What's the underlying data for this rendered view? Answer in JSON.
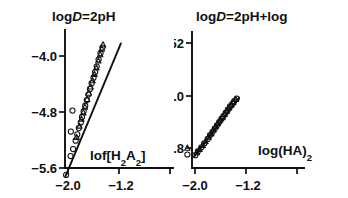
{
  "figure": {
    "background_color": "#ffffff",
    "ink_color": "#101010",
    "width": 348,
    "height": 198
  },
  "chart_data": [
    {
      "type": "scatter",
      "panel": "left",
      "title": "logD=2pH",
      "title_parts": {
        "pre": "log",
        "italic": "D",
        "post": "=2pH"
      },
      "xlabel": "lof[H₂A₂]",
      "xlabel_parts": {
        "base": "lof[H",
        "sub1": "2",
        "mid": "A",
        "sub2": "2",
        "tail": "]"
      },
      "ylabel": "",
      "xticks": [
        "−2.0",
        "−1.2"
      ],
      "xtick_values": [
        -2.0,
        -1.2
      ],
      "yticks": [
        "−4.0",
        "−4.8",
        "−5.6"
      ],
      "ytick_values": [
        -4.0,
        -4.8,
        -5.6
      ],
      "xlim": [
        -2.18,
        -0.95
      ],
      "ylim": [
        -5.85,
        -3.75
      ],
      "grid": false,
      "legend": "none",
      "fit_line": {
        "x": [
          -2.04,
          -1.17
        ],
        "y": [
          -5.72,
          -3.82
        ],
        "slope": 2.18
      },
      "series": [
        {
          "name": "circles",
          "marker": "circle",
          "points": [
            [
              -2.03,
              -5.7
            ],
            [
              -1.96,
              -5.43
            ],
            [
              -1.92,
              -5.33
            ],
            [
              -1.88,
              -5.21
            ],
            [
              -1.855,
              -5.12
            ],
            [
              -1.83,
              -5.03
            ],
            [
              -1.8,
              -4.95
            ],
            [
              -1.78,
              -4.87
            ],
            [
              -1.755,
              -4.79
            ],
            [
              -1.73,
              -4.71
            ],
            [
              -1.705,
              -4.63
            ],
            [
              -1.68,
              -4.55
            ],
            [
              -1.655,
              -4.47
            ],
            [
              -1.63,
              -4.39
            ],
            [
              -1.6,
              -4.31
            ],
            [
              -1.575,
              -4.23
            ],
            [
              -1.55,
              -4.15
            ],
            [
              -1.52,
              -4.05
            ],
            [
              -1.49,
              -3.96
            ],
            [
              -1.46,
              -3.88
            ],
            [
              -1.93,
              -4.78
            ],
            [
              -1.955,
              -5.08
            ]
          ]
        },
        {
          "name": "triangles",
          "marker": "triangle",
          "points": [
            [
              -1.865,
              -5.16
            ],
            [
              -1.82,
              -5.0
            ],
            [
              -1.79,
              -4.9
            ],
            [
              -1.76,
              -4.81
            ],
            [
              -1.735,
              -4.73
            ],
            [
              -1.7,
              -4.62
            ],
            [
              -1.675,
              -4.53
            ],
            [
              -1.645,
              -4.44
            ],
            [
              -1.615,
              -4.35
            ],
            [
              -1.585,
              -4.26
            ],
            [
              -1.555,
              -4.17
            ],
            [
              -1.525,
              -4.07
            ],
            [
              -1.495,
              -3.98
            ],
            [
              -1.47,
              -3.9
            ],
            [
              -1.45,
              -3.84
            ]
          ]
        }
      ]
    },
    {
      "type": "scatter",
      "panel": "right",
      "title": "logD=2pH+log",
      "title_parts": {
        "pre": "log",
        "italic": "D",
        "post": "=2pH+log"
      },
      "xlabel": "log(HA)₂",
      "xlabel_parts": {
        "base": "log(HA)",
        "sub1": "2"
      },
      "ylabel": "",
      "xticks": [
        "−2.0",
        "−1.2"
      ],
      "xtick_values": [
        -2.0,
        -1.2
      ],
      "yticks": [
        "−52",
        "−5.0",
        "−5.8"
      ],
      "ytick_values": [
        -5.2,
        -5.0,
        -5.8
      ],
      "xlim": [
        -2.18,
        -0.95
      ],
      "ylim": [
        -6.0,
        -4.95
      ],
      "grid": false,
      "legend": "none",
      "fit_line": {
        "x": [
          -2.01,
          -1.31
        ],
        "y": [
          -5.93,
          -5.03
        ],
        "slope": 1.29
      },
      "series": [
        {
          "name": "circles",
          "marker": "circle",
          "points": [
            [
              -1.995,
              -5.91
            ],
            [
              -1.955,
              -5.85
            ],
            [
              -1.9,
              -5.79
            ],
            [
              -1.855,
              -5.73
            ],
            [
              -1.8,
              -5.66
            ],
            [
              -1.765,
              -5.6
            ],
            [
              -1.725,
              -5.55
            ],
            [
              -1.69,
              -5.5
            ],
            [
              -1.655,
              -5.45
            ],
            [
              -1.62,
              -5.4
            ],
            [
              -1.585,
              -5.35
            ],
            [
              -1.555,
              -5.31
            ],
            [
              -1.52,
              -5.26
            ],
            [
              -1.485,
              -5.21
            ],
            [
              -1.45,
              -5.16
            ],
            [
              -1.415,
              -5.12
            ],
            [
              -1.385,
              -5.08
            ],
            [
              -1.345,
              -5.04
            ]
          ]
        },
        {
          "name": "triangles",
          "marker": "triangle",
          "points": [
            [
              -1.97,
              -5.87
            ],
            [
              -1.93,
              -5.82
            ],
            [
              -1.88,
              -5.76
            ],
            [
              -1.835,
              -5.7
            ],
            [
              -1.785,
              -5.63
            ],
            [
              -1.745,
              -5.58
            ],
            [
              -1.71,
              -5.52
            ],
            [
              -1.675,
              -5.47
            ],
            [
              -1.64,
              -5.42
            ],
            [
              -1.605,
              -5.37
            ],
            [
              -1.57,
              -5.33
            ],
            [
              -1.535,
              -5.28
            ],
            [
              -1.5,
              -5.23
            ],
            [
              -1.465,
              -5.18
            ],
            [
              -1.43,
              -5.14
            ],
            [
              -1.4,
              -5.1
            ],
            [
              -1.36,
              -5.05
            ]
          ]
        },
        {
          "name": "outliers",
          "marker": "mixed",
          "points": [
            {
              "x": -2.12,
              "y": -5.8,
              "marker": "triangle"
            },
            {
              "x": -2.12,
              "y": -5.9,
              "marker": "circle"
            }
          ]
        }
      ]
    }
  ]
}
